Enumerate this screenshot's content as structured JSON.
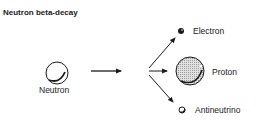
{
  "title": "Neutron beta-decay",
  "particles": {
    "neutron": {
      "label": "Neutron"
    },
    "electron": {
      "label": "Electron"
    },
    "proton": {
      "label": "Proton"
    },
    "antineutrino": {
      "label": "Antineutrino"
    }
  },
  "colors": {
    "ink": "#1a1a1a",
    "proton_fill": "#c8c8c8",
    "background": "#ffffff"
  }
}
